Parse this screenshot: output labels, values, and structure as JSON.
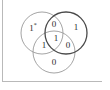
{
  "figure": {
    "kind": "venn-diagram",
    "background_color": "#ffffff",
    "frame": {
      "rule_color": "#b9b9b9",
      "left_rule_name": "left vertical rule",
      "bottom_rule_name": "bottom horizontal rule"
    },
    "circles": [
      {
        "id": "left",
        "name": "left-set-circle",
        "cx": 42,
        "cy": 33,
        "r": 21,
        "stroke": "#9a9a9a",
        "stroke_width": 0.9
      },
      {
        "id": "right",
        "name": "right-set-circle",
        "cx": 66,
        "cy": 33,
        "r": 21,
        "stroke": "#4a4a4a",
        "stroke_width": 1.3
      },
      {
        "id": "bottom",
        "name": "bottom-set-circle",
        "cx": 54,
        "cy": 52,
        "r": 21,
        "stroke": "#9a9a9a",
        "stroke_width": 0.9
      }
    ],
    "regions": [
      {
        "id": "left_only",
        "name": "left-only-region",
        "label": "1",
        "marker": "*",
        "x": 33,
        "y": 27
      },
      {
        "id": "left_right",
        "name": "left-right-intersection-region",
        "label": "0",
        "marker": "",
        "x": 54,
        "y": 24
      },
      {
        "id": "right_only",
        "name": "right-only-region",
        "label": "1",
        "marker": "",
        "x": 76,
        "y": 27
      },
      {
        "id": "left_bottom",
        "name": "left-bottom-intersection-region",
        "label": "1",
        "marker": "",
        "x": 44,
        "y": 45
      },
      {
        "id": "center",
        "name": "center-intersection-region",
        "label": "1",
        "marker": "",
        "x": 56,
        "y": 38
      },
      {
        "id": "right_bottom",
        "name": "right-bottom-intersection-region",
        "label": "0",
        "marker": "",
        "x": 68,
        "y": 45
      },
      {
        "id": "bottom_only",
        "name": "bottom-only-region",
        "label": "0",
        "marker": "",
        "x": 54,
        "y": 62
      }
    ]
  }
}
